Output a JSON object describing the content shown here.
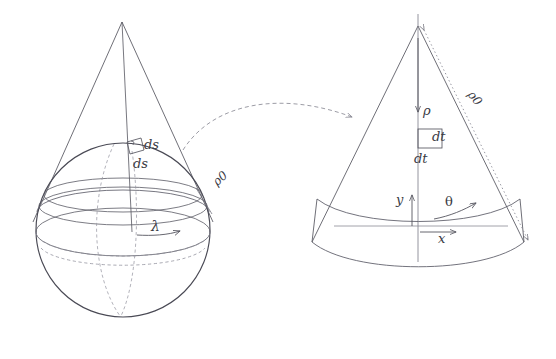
{
  "figure": {
    "title": "",
    "caption": "",
    "background_color": "#ffffff",
    "line_color": "#55555f",
    "accent_color": "#6d6d78",
    "label_color": "#3a3a44"
  },
  "left_panel": {
    "name": "sphere-with-cone",
    "description": "Sphere with circumscribed cone, latitude circles and meridians",
    "labels": {
      "ds_meridional": "ds",
      "ds_parallel": "ds",
      "rho_zero": "ρ0",
      "lambda": "λ"
    }
  },
  "right_panel": {
    "name": "unrolled-cone-sector",
    "description": "Developed (unrolled) cone as a circular sector",
    "labels": {
      "rho": "ρ",
      "rho_zero": "ρ0",
      "dt_horizontal": "dt",
      "dt_vertical": "dt",
      "y_axis": "y",
      "theta": "θ",
      "x_axis": "x"
    }
  },
  "mapping_arrow": {
    "name": "projection-arrow",
    "style": "dashed-curve-with-arrowhead"
  }
}
